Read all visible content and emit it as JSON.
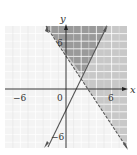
{
  "graph": {
    "x_axis_label": "x",
    "y_axis_label": "y",
    "tick_labels": {
      "x_neg": "−6",
      "origin": "0",
      "x_pos": "6",
      "y_pos": "6",
      "y_neg": "−6"
    },
    "range": {
      "x": [
        -8,
        8
      ],
      "y": [
        -8,
        8
      ]
    },
    "grid_step": 1,
    "lines": [
      {
        "name": "boundary-decreasing",
        "equation": "y = -1.5x + 4",
        "style": "dashed"
      },
      {
        "name": "boundary-increasing",
        "equation": "y = 2x - 3",
        "style": "solid"
      }
    ],
    "colors": {
      "grid": "#d8d8d8",
      "background": "#f4f4f4",
      "light_shade": "#c8c8c8",
      "dark_shade": "#9a9a9a",
      "line": "#555555"
    }
  }
}
